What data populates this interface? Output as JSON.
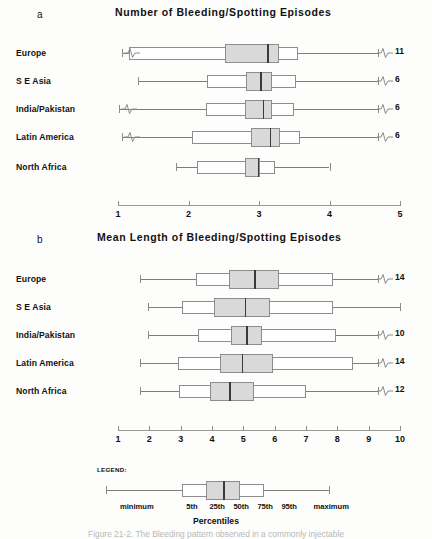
{
  "figure": {
    "panels": [
      {
        "letter": "a",
        "title": "Number of Bleeding/Spotting Episodes",
        "axis": {
          "min": 1,
          "max": 5,
          "ticks": [
            1,
            2,
            3,
            4,
            5
          ],
          "ticklabels": [
            "1",
            "2",
            "3",
            "4",
            "5"
          ]
        },
        "rows": [
          {
            "label": "Europe",
            "minimum": 1.05,
            "p5": 1.15,
            "p25": 2.52,
            "p50": 3.12,
            "p75": 3.28,
            "p95": 3.55,
            "maximum": 4.75,
            "break_left": true,
            "break_right": true,
            "max_label": "11"
          },
          {
            "label": "S E Asia",
            "minimum": 1.28,
            "p5": 2.26,
            "p25": 2.82,
            "p50": 3.02,
            "p75": 3.18,
            "p95": 3.52,
            "maximum": 4.12,
            "break_left": false,
            "break_right": true,
            "max_label": "6"
          },
          {
            "label": "India/Pakistan",
            "minimum": 1.02,
            "p5": 2.25,
            "p25": 2.8,
            "p50": 3.05,
            "p75": 3.18,
            "p95": 3.5,
            "maximum": 4.28,
            "break_left": true,
            "break_right": true,
            "max_label": "6"
          },
          {
            "label": "Latin America",
            "minimum": 1.05,
            "p5": 2.05,
            "p25": 2.88,
            "p50": 3.15,
            "p75": 3.3,
            "p95": 3.58,
            "maximum": 4.35,
            "break_left": true,
            "break_right": true,
            "max_label": "6"
          },
          {
            "label": "North Africa",
            "minimum": 1.82,
            "p5": 2.12,
            "p25": 2.8,
            "p50": 2.98,
            "p75": 3.02,
            "p95": 3.22,
            "maximum": 4.0,
            "break_left": false,
            "break_right": false,
            "max_label": ""
          }
        ]
      },
      {
        "letter": "b",
        "title": "Mean Length of Bleeding/Spotting Episodes",
        "axis": {
          "min": 1,
          "max": 10,
          "ticks": [
            1,
            2,
            3,
            4,
            5,
            6,
            7,
            8,
            9,
            10
          ],
          "ticklabels": [
            "1",
            "2",
            "3",
            "4",
            "5",
            "6",
            "7",
            "8",
            "9",
            "10"
          ]
        },
        "rows": [
          {
            "label": "Europe",
            "minimum": 1.7,
            "p5": 3.5,
            "p25": 4.55,
            "p50": 5.35,
            "p75": 6.15,
            "p95": 7.85,
            "maximum": 9.6,
            "break_left": false,
            "break_right": true,
            "max_label": "14"
          },
          {
            "label": "S E Asia",
            "minimum": 1.95,
            "p5": 3.05,
            "p25": 4.05,
            "p50": 5.05,
            "p75": 5.85,
            "p95": 7.85,
            "maximum": 10.0,
            "break_left": false,
            "break_right": false,
            "max_label": ""
          },
          {
            "label": "India/Pakistan",
            "minimum": 1.95,
            "p5": 3.55,
            "p25": 4.6,
            "p50": 5.1,
            "p75": 5.6,
            "p95": 7.95,
            "maximum": 9.55,
            "break_left": false,
            "break_right": true,
            "max_label": "10"
          },
          {
            "label": "Latin America",
            "minimum": 1.7,
            "p5": 2.9,
            "p25": 4.25,
            "p50": 4.95,
            "p75": 5.95,
            "p95": 8.5,
            "maximum": 9.6,
            "break_left": false,
            "break_right": true,
            "max_label": "14"
          },
          {
            "label": "North Africa",
            "minimum": 1.7,
            "p5": 2.95,
            "p25": 3.95,
            "p50": 4.55,
            "p75": 5.35,
            "p95": 7.0,
            "maximum": 9.6,
            "break_left": false,
            "break_right": true,
            "max_label": "12"
          }
        ]
      }
    ],
    "legend": {
      "title": "LEGEND:",
      "axis_label": "Percentiles",
      "box": {
        "minimum": 0.04,
        "p5": 0.36,
        "p25": 0.46,
        "p50": 0.53,
        "p75": 0.6,
        "p95": 0.7,
        "maximum": 0.97
      },
      "labels": [
        {
          "text": "minimum",
          "pos": 0.17
        },
        {
          "text": "5th",
          "pos": 0.4
        },
        {
          "text": "25th",
          "pos": 0.505
        },
        {
          "text": "50th",
          "pos": 0.605
        },
        {
          "text": "75th",
          "pos": 0.705
        },
        {
          "text": "95th",
          "pos": 0.805
        },
        {
          "text": "maximum",
          "pos": 0.98
        }
      ]
    },
    "caption": "Figure 21-2. The Bleeding pattern observed in a commonly injectable"
  },
  "chart_data": {
    "type": "box",
    "panels": [
      {
        "id": "a",
        "title": "Number of Bleeding/Spotting Episodes",
        "xlabel": "",
        "ylabel": "",
        "xlim": [
          1,
          5
        ],
        "grid": false,
        "categories": [
          "Europe",
          "S E Asia",
          "India/Pakistan",
          "Latin America",
          "North Africa"
        ],
        "series": [
          {
            "name": "minimum",
            "values": [
              1.05,
              1.28,
              1.02,
              1.05,
              1.82
            ]
          },
          {
            "name": "5th",
            "values": [
              1.15,
              2.26,
              2.25,
              2.05,
              2.12
            ]
          },
          {
            "name": "25th",
            "values": [
              2.52,
              2.82,
              2.8,
              2.88,
              2.8
            ]
          },
          {
            "name": "50th",
            "values": [
              3.12,
              3.02,
              3.05,
              3.15,
              2.98
            ]
          },
          {
            "name": "75th",
            "values": [
              3.28,
              3.18,
              3.18,
              3.3,
              3.02
            ]
          },
          {
            "name": "95th",
            "values": [
              3.55,
              3.52,
              3.5,
              3.58,
              3.22
            ]
          },
          {
            "name": "maximum",
            "values": [
              11,
              6,
              6,
              6,
              4.0
            ]
          }
        ],
        "annotations": [
          "11",
          "6",
          "6",
          "6",
          ""
        ]
      },
      {
        "id": "b",
        "title": "Mean Length of Bleeding/Spotting Episodes",
        "xlabel": "",
        "ylabel": "",
        "xlim": [
          1,
          10
        ],
        "grid": false,
        "categories": [
          "Europe",
          "S E Asia",
          "India/Pakistan",
          "Latin America",
          "North Africa"
        ],
        "series": [
          {
            "name": "minimum",
            "values": [
              1.7,
              1.95,
              1.95,
              1.7,
              1.7
            ]
          },
          {
            "name": "5th",
            "values": [
              3.5,
              3.05,
              3.55,
              2.9,
              2.95
            ]
          },
          {
            "name": "25th",
            "values": [
              4.55,
              4.05,
              4.6,
              4.25,
              3.95
            ]
          },
          {
            "name": "50th",
            "values": [
              5.35,
              5.05,
              5.1,
              4.95,
              4.55
            ]
          },
          {
            "name": "75th",
            "values": [
              6.15,
              5.85,
              5.6,
              5.95,
              5.35
            ]
          },
          {
            "name": "95th",
            "values": [
              7.85,
              7.85,
              7.95,
              8.5,
              7.0
            ]
          },
          {
            "name": "maximum",
            "values": [
              14,
              10.0,
              10,
              14,
              12
            ]
          }
        ],
        "annotations": [
          "14",
          "",
          "10",
          "14",
          "12"
        ]
      }
    ],
    "legend": {
      "position": "bottom",
      "entries": [
        "minimum",
        "5th",
        "25th",
        "50th",
        "75th",
        "95th",
        "maximum"
      ],
      "axis_label": "Percentiles"
    }
  }
}
